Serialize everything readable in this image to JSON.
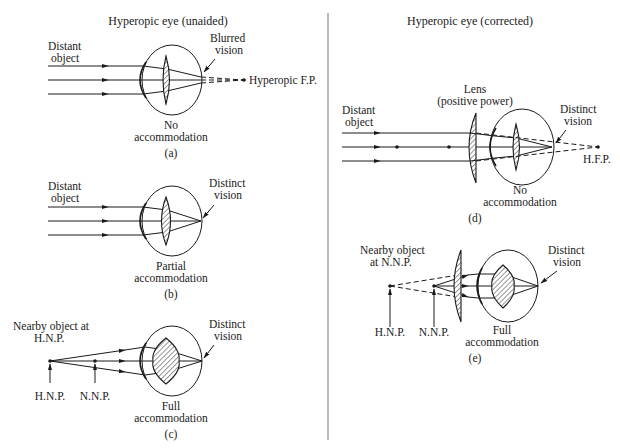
{
  "figure": {
    "left_title": "Hyperopic eye (unaided)",
    "right_title": "Hyperopic eye (corrected)",
    "panels": {
      "a": {
        "caption": "(a)",
        "object_label_1": "Distant",
        "object_label_2": "object",
        "retina_label_1": "Blurred",
        "retina_label_2": "vision",
        "focal_label": "Hyperopic F.P.",
        "accommodation_1": "No",
        "accommodation_2": "accommodation"
      },
      "b": {
        "caption": "(b)",
        "object_label_1": "Distant",
        "object_label_2": "object",
        "retina_label_1": "Distinct",
        "retina_label_2": "vision",
        "accommodation_1": "Partial",
        "accommodation_2": "accommodation"
      },
      "c": {
        "caption": "(c)",
        "object_label_1": "Nearby object at",
        "object_label_2": "H.N.P.",
        "retina_label_1": "Distinct",
        "retina_label_2": "vision",
        "marker_1": "H.N.P.",
        "marker_2": "N.N.P.",
        "accommodation_1": "Full",
        "accommodation_2": "accommodation"
      },
      "d": {
        "caption": "(d)",
        "lens_label_1": "Lens",
        "lens_label_2": "(positive power)",
        "object_label_1": "Distant",
        "object_label_2": "object",
        "retina_label_1": "Distinct",
        "retina_label_2": "vision",
        "focal_label": "H.F.P.",
        "accommodation_1": "No",
        "accommodation_2": "accommodation"
      },
      "e": {
        "caption": "(e)",
        "object_label_1": "Nearby object",
        "object_label_2": "at N.N.P.",
        "retina_label_1": "Distinct",
        "retina_label_2": "vision",
        "marker_1": "H.N.P.",
        "marker_2": "N.N.P.",
        "accommodation_1": "Full",
        "accommodation_2": "accommodation"
      }
    }
  }
}
